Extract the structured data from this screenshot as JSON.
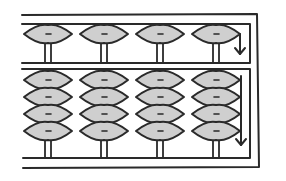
{
  "diagram": {
    "colors": {
      "background": "#ffffff",
      "line": "#2a2a2a",
      "bead_fill": "#cfcfcf"
    },
    "rods": [
      {
        "x": 48,
        "upper_beads": 1,
        "lower_beads": 4
      },
      {
        "x": 104,
        "upper_beads": 1,
        "lower_beads": 4
      },
      {
        "x": 160,
        "upper_beads": 1,
        "lower_beads": 4
      },
      {
        "x": 216,
        "upper_beads": 1,
        "lower_beads": 4
      }
    ],
    "arrows": [
      {
        "name": "upper-deck-arrow",
        "direction": "down"
      },
      {
        "name": "lower-deck-arrow",
        "direction": "down"
      }
    ]
  }
}
